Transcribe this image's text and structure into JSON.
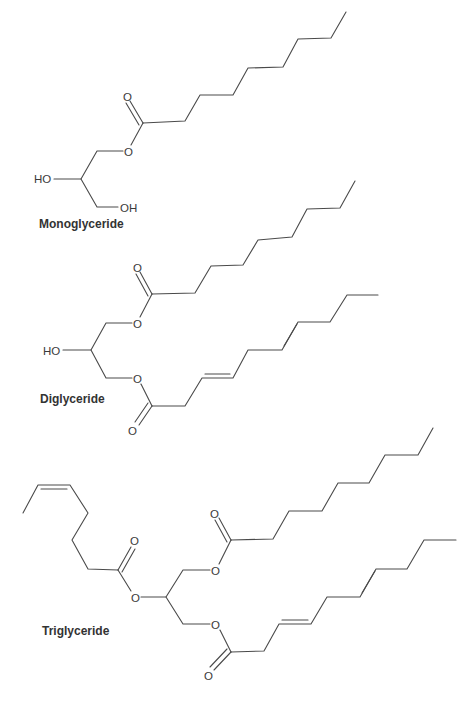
{
  "diagram": {
    "type": "chemical-structures",
    "colors": {
      "bond": "#4a4a4a",
      "text": "#333333",
      "background": "#ffffff"
    },
    "molecules": [
      {
        "name": "Monoglyceride",
        "atoms": {
          "carbonyl_o": "O",
          "ester_o": "O",
          "hydroxyl_1": "HO",
          "hydroxyl_2": "OH"
        }
      },
      {
        "name": "Diglyceride",
        "atoms": {
          "carbonyl_o_top": "O",
          "ester_o_top": "O",
          "hydroxyl": "HO",
          "ester_o_bottom": "O",
          "carbonyl_o_bottom": "O"
        }
      },
      {
        "name": "Triglyceride",
        "atoms": {
          "carbonyl_o_left": "O",
          "ester_o_left": "O",
          "ester_o_top": "O",
          "carbonyl_o_top": "O",
          "ester_o_bottom": "O",
          "carbonyl_o_bottom": "O"
        }
      }
    ]
  }
}
